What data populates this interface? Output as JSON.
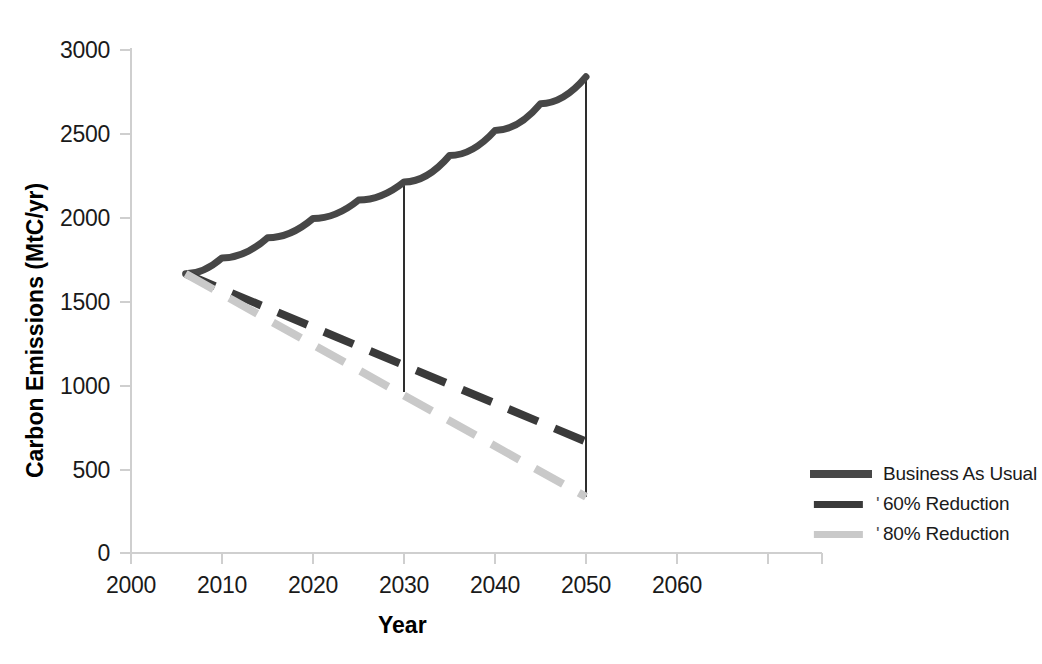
{
  "chart_data": {
    "type": "line",
    "title": "",
    "xlabel": "Year",
    "ylabel": "Carbon Emissions (MtC/yr)",
    "xlim": [
      2000,
      2060
    ],
    "ylim": [
      0,
      3000
    ],
    "xticks": [
      "2000",
      "2010",
      "2020",
      "2030",
      "2040",
      "2050",
      "2060"
    ],
    "yticks": [
      "0",
      "500",
      "1000",
      "1500",
      "2000",
      "2500",
      "3000"
    ],
    "grid": false,
    "legend_position": "right-outside",
    "series": [
      {
        "name": "Business As Usual",
        "style": "solid",
        "color": "#474747",
        "x": [
          2006,
          2010,
          2015,
          2020,
          2025,
          2030,
          2035,
          2040,
          2045,
          2050
        ],
        "values": [
          1665,
          1760,
          1880,
          1995,
          2105,
          2213,
          2370,
          2520,
          2680,
          2840
        ]
      },
      {
        "name": "60% Reduction",
        "style": "dashed",
        "color": "#3a3a3a",
        "x": [
          2006,
          2010,
          2015,
          2020,
          2025,
          2030,
          2035,
          2040,
          2045,
          2050
        ],
        "values": [
          1665,
          1570,
          1450,
          1330,
          1215,
          1105,
          995,
          885,
          775,
          665
        ]
      },
      {
        "name": "80% Reduction",
        "style": "dashed",
        "color": "#c9c9c9",
        "x": [
          2006,
          2010,
          2015,
          2020,
          2025,
          2030,
          2035,
          2040,
          2045,
          2050
        ],
        "values": [
          1665,
          1545,
          1395,
          1250,
          1105,
          960,
          835,
          710,
          585,
          335
        ]
      }
    ],
    "annotations": [
      {
        "type": "vertical-connector",
        "x": 2030,
        "y_top": 2213,
        "y_bottom": 960
      },
      {
        "type": "vertical-connector",
        "x": 2050,
        "y_top": 2840,
        "y_bottom": 335
      }
    ]
  },
  "axis": {
    "y_title": "Carbon Emissions (MtC/yr)",
    "x_title": "Year",
    "y_ticks": [
      "3000",
      "2500",
      "2000",
      "1500",
      "1000",
      "500",
      "0"
    ],
    "x_ticks": [
      "2000",
      "2010",
      "2020",
      "2030",
      "2040",
      "2050",
      "2060"
    ]
  },
  "legend": {
    "items": [
      {
        "label": "Business As Usual",
        "color": "#474747",
        "style": "solid",
        "marker": ""
      },
      {
        "label": "60% Reduction",
        "color": "#3a3a3a",
        "style": "dashed",
        "marker": "'"
      },
      {
        "label": "80% Reduction",
        "color": "#c9c9c9",
        "style": "dashed",
        "marker": "'"
      }
    ]
  },
  "colors": {
    "bau": "#474747",
    "reduction60": "#3a3a3a",
    "reduction80": "#c9c9c9",
    "axis": "#cfcfcf",
    "text": "#1a1a1a"
  }
}
